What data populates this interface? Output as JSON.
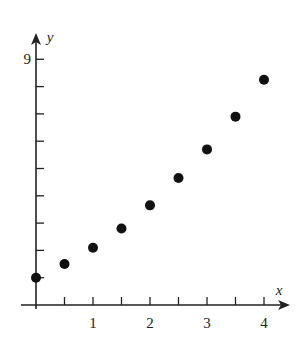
{
  "chart_data": {
    "type": "scatter",
    "title": "",
    "xlabel": "x",
    "ylabel": "y",
    "x": [
      0,
      0.5,
      1,
      1.5,
      2,
      2.5,
      3,
      3.5,
      4
    ],
    "y": [
      1,
      1.5,
      2.1,
      2.8,
      3.65,
      4.65,
      5.7,
      6.9,
      8.25
    ],
    "xlim": [
      0,
      4.3
    ],
    "ylim": [
      0,
      9.5
    ],
    "x_ticks": [
      0.5,
      1,
      1.5,
      2,
      2.5,
      3,
      3.5,
      4
    ],
    "x_tick_labels": [
      {
        "value": 1,
        "label": "1"
      },
      {
        "value": 2,
        "label": "2"
      },
      {
        "value": 3,
        "label": "3"
      },
      {
        "value": 4,
        "label": "4"
      }
    ],
    "y_ticks": [
      1,
      2,
      3,
      4,
      5,
      6,
      7,
      8,
      9
    ],
    "y_tick_labels": [
      {
        "value": 9,
        "label": "9"
      }
    ],
    "grid": false,
    "legend": null
  }
}
